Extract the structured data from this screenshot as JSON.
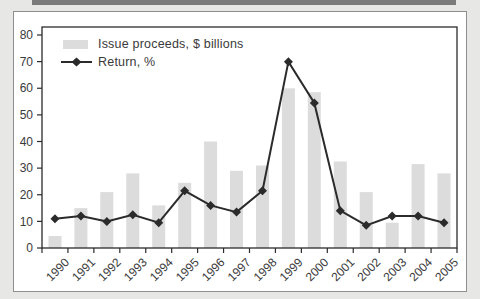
{
  "chart_data": {
    "type": "bar",
    "categories": [
      "1990",
      "1991",
      "1992",
      "1993",
      "1994",
      "1995",
      "1996",
      "1997",
      "1998",
      "1999",
      "2000",
      "2001",
      "2002",
      "2003",
      "2004",
      "2005"
    ],
    "series": [
      {
        "name": "Issue proceeds, $ billions",
        "type": "bar",
        "values": [
          4.5,
          15,
          21,
          28,
          16,
          24.5,
          40,
          29,
          31,
          60,
          58.5,
          32.5,
          21,
          9.5,
          31.5,
          28
        ]
      },
      {
        "name": "Return, %",
        "type": "line",
        "marker": "diamond",
        "values": [
          11,
          12,
          10,
          12.5,
          9.5,
          21.5,
          16,
          13.5,
          21.5,
          70,
          54.5,
          14,
          8.5,
          12,
          12,
          9.5
        ]
      }
    ],
    "title": "",
    "xlabel": "",
    "ylabel": "",
    "ylim": [
      0,
      80
    ],
    "yticks": [
      0,
      10,
      20,
      30,
      40,
      50,
      60,
      70,
      80
    ],
    "grid": false,
    "legend_position": "top-left-inside",
    "colors": {
      "bar_fill": "#dcdcdc",
      "line": "#2b2b2b",
      "axis": "#2b2b2b",
      "tick_text": "#3a3a3a",
      "panel_bg": "#ffffff",
      "page_bg": "#e7e7e5"
    }
  }
}
